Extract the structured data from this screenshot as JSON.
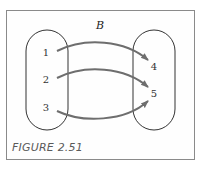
{
  "figure": {
    "caption": "FIGURE 2.51",
    "relation_label": "B"
  },
  "domain_set": {
    "elements": [
      "1",
      "2",
      "3"
    ]
  },
  "codomain_set": {
    "elements": [
      "4",
      "5"
    ]
  },
  "mappings": [
    {
      "from": "1",
      "to": "4"
    },
    {
      "from": "2",
      "to": "5"
    },
    {
      "from": "3",
      "to": "5"
    }
  ],
  "colors": {
    "arrow": "#6e6e6e",
    "outline": "#333333",
    "frame": "#8a8a8a",
    "caption": "#5a5a5a"
  }
}
